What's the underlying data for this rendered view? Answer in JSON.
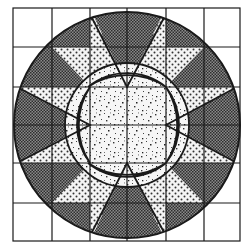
{
  "figure": {
    "grid": {
      "rows": 6,
      "cols": 6
    },
    "colors": {
      "background": "#ffffff",
      "line": "#1a1a1a",
      "dark_fill": "#6a6a6a",
      "dot_fill": "#f2f2f2",
      "speckle_fill": "#f4f4f4",
      "lens_fill": "#ffffff"
    },
    "regions": [
      {
        "name": "outer-corners",
        "fill": "plain white"
      },
      {
        "name": "outer-ring",
        "fill": "dark crosshatch"
      },
      {
        "name": "star-points",
        "fill": "dotted"
      },
      {
        "name": "center-square",
        "fill": "speckled"
      },
      {
        "name": "lenses",
        "fill": "plain white"
      }
    ]
  }
}
